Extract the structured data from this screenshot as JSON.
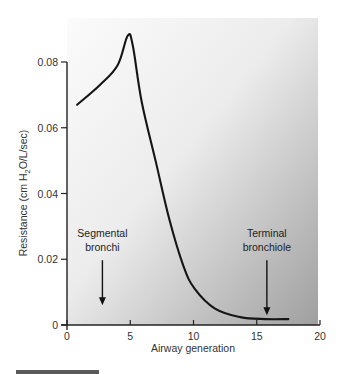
{
  "chart_data": {
    "type": "line",
    "title": "",
    "xlabel": "Airway generation",
    "ylabel": "Resistance (cm H2O/L/sec)",
    "ylabel_parts": {
      "pre": "Resistance (cm H",
      "sub": "2",
      "post": "O/L/sec)"
    },
    "xlim": [
      0,
      20
    ],
    "ylim": [
      0,
      0.08
    ],
    "xticks": [
      0,
      5,
      10,
      15,
      20
    ],
    "xtick_labels": [
      "0",
      "5",
      "10",
      "15",
      "20"
    ],
    "yticks": [
      0,
      0.02,
      0.04,
      0.06,
      0.08
    ],
    "ytick_labels": [
      "0",
      "0.02",
      "0.04",
      "0.06",
      "0.08"
    ],
    "grid": false,
    "legend": null,
    "series": [
      {
        "name": "Airway resistance",
        "x": [
          0.8,
          2.6,
          4.0,
          4.8,
          5.2,
          5.9,
          7.0,
          8.1,
          9.2,
          10.1,
          11.7,
          13.7,
          15.7,
          17.5
        ],
        "values": [
          0.067,
          0.073,
          0.079,
          0.088,
          0.085,
          0.068,
          0.05,
          0.032,
          0.018,
          0.011,
          0.005,
          0.0024,
          0.0018,
          0.0018
        ]
      }
    ],
    "annotations": [
      {
        "lines": [
          "Segmental",
          "bronchi"
        ],
        "arrow_x": 2.8,
        "arrow_from": 0.02,
        "arrow_to": 0.006
      },
      {
        "lines": [
          "Terminal",
          "bronchiole"
        ],
        "arrow_x": 15.8,
        "arrow_from": 0.02,
        "arrow_to": 0.003
      }
    ],
    "background": {
      "gradient_from": "#fbfbfb",
      "gradient_to": "#9f9f9f"
    }
  }
}
